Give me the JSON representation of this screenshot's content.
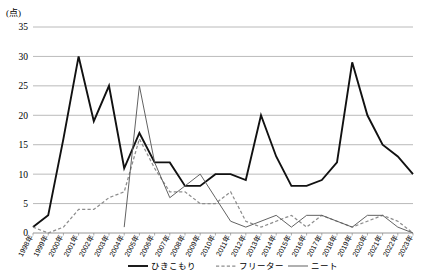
{
  "chart_data": {
    "type": "line",
    "title": "",
    "xlabel": "",
    "ylabel": "(点)",
    "ylim": [
      0,
      35
    ],
    "ytick_step": 5,
    "yticks": [
      "0",
      "5",
      "10",
      "15",
      "20",
      "25",
      "30",
      "35"
    ],
    "grid": true,
    "legend_position": "bottom",
    "categories": [
      "1998年",
      "1999年",
      "2000年",
      "2001年",
      "2002年",
      "2003年",
      "2004年",
      "2005年",
      "2006年",
      "2007年",
      "2008年",
      "2009年",
      "2010年",
      "2011年",
      "2012年",
      "2013年",
      "2014年",
      "2015年",
      "2016年",
      "2017年",
      "2018年",
      "2019年",
      "2020年",
      "2021年",
      "2022年",
      "2023年"
    ],
    "series": [
      {
        "name": "ひきこもり",
        "style": "solid-thick",
        "color": "#111111",
        "values": [
          1,
          3,
          16,
          30,
          19,
          25,
          11,
          17,
          12,
          12,
          8,
          8,
          10,
          10,
          9,
          20,
          13,
          8,
          8,
          9,
          12,
          29,
          20,
          15,
          13,
          10
        ]
      },
      {
        "name": "フリーター",
        "style": "dashed",
        "color": "#8d8d8d",
        "values": [
          1,
          0,
          1,
          4,
          4,
          6,
          7,
          16,
          11,
          7,
          7,
          5,
          5,
          7,
          2,
          1,
          2,
          3,
          1,
          3,
          2,
          1,
          2,
          3,
          2,
          0
        ]
      },
      {
        "name": "ニート",
        "style": "solid-thin",
        "color": "#5a5a5a",
        "values": [
          null,
          null,
          null,
          null,
          null,
          null,
          1,
          25,
          12,
          6,
          8,
          10,
          6,
          2,
          1,
          2,
          3,
          1,
          3,
          3,
          2,
          1,
          3,
          3,
          1,
          0
        ]
      }
    ]
  },
  "legend": {
    "items": [
      {
        "label": "ひきこもり"
      },
      {
        "label": "フリーター"
      },
      {
        "label": "ニート"
      }
    ]
  }
}
